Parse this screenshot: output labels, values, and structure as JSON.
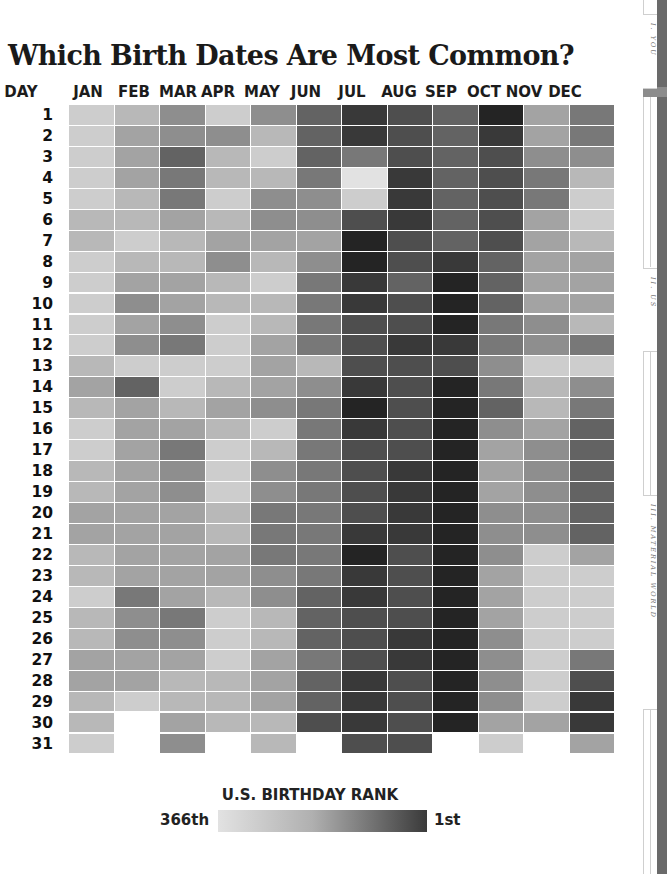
{
  "title": "Which Birth Dates Are Most Common?",
  "header": {
    "day_label": "DAY",
    "months": [
      "JAN",
      "FEB",
      "MAR",
      "APR",
      "MAY",
      "JUN",
      "JUL",
      "AUG",
      "SEP",
      "OCT",
      "NOV",
      "DEC"
    ]
  },
  "days": [
    "1",
    "2",
    "3",
    "4",
    "5",
    "6",
    "7",
    "8",
    "9",
    "10",
    "11",
    "12",
    "13",
    "14",
    "15",
    "16",
    "17",
    "18",
    "19",
    "20",
    "21",
    "22",
    "23",
    "24",
    "25",
    "26",
    "27",
    "28",
    "29",
    "30",
    "31"
  ],
  "legend": {
    "title": "U.S. BIRTHDAY RANK",
    "low_label": "366th",
    "high_label": "1st",
    "color_low": "#e2e2e2",
    "color_high": "#3a3a3a"
  },
  "side_tabs": [
    {
      "label": "I. YOU"
    },
    {
      "label": "II. US"
    },
    {
      "label": "III. MATERIAL WORLD"
    }
  ],
  "chart_data": {
    "type": "heatmap",
    "title": "Which Birth Dates Are Most Common?",
    "xlabel": "Month",
    "ylabel": "Day",
    "x_categories": [
      "JAN",
      "FEB",
      "MAR",
      "APR",
      "MAY",
      "JUN",
      "JUL",
      "AUG",
      "SEP",
      "OCT",
      "NOV",
      "DEC"
    ],
    "y_categories": [
      "1",
      "2",
      "3",
      "4",
      "5",
      "6",
      "7",
      "8",
      "9",
      "10",
      "11",
      "12",
      "13",
      "14",
      "15",
      "16",
      "17",
      "18",
      "19",
      "20",
      "21",
      "22",
      "23",
      "24",
      "25",
      "26",
      "27",
      "28",
      "29",
      "30",
      "31"
    ],
    "value_meaning": "relative birthday popularity (0 = least common / rank 366th, 9 = most common / rank 1st), estimated from shading",
    "legend": {
      "title": "U.S. BIRTHDAY RANK",
      "min_label": "366th",
      "max_label": "1st"
    },
    "values": [
      [
        1,
        2,
        4,
        1,
        4,
        6,
        8,
        7,
        6,
        9,
        3,
        5
      ],
      [
        1,
        3,
        4,
        4,
        2,
        6,
        8,
        7,
        6,
        8,
        3,
        5
      ],
      [
        1,
        3,
        6,
        2,
        1,
        6,
        5,
        7,
        6,
        7,
        4,
        4
      ],
      [
        1,
        3,
        5,
        2,
        2,
        5,
        0,
        8,
        6,
        7,
        5,
        2
      ],
      [
        1,
        2,
        5,
        1,
        4,
        4,
        1,
        8,
        6,
        7,
        5,
        1
      ],
      [
        2,
        2,
        3,
        2,
        4,
        4,
        7,
        8,
        6,
        7,
        3,
        1
      ],
      [
        2,
        1,
        2,
        3,
        3,
        3,
        9,
        7,
        6,
        7,
        3,
        2
      ],
      [
        1,
        2,
        2,
        4,
        2,
        4,
        9,
        7,
        8,
        6,
        3,
        3
      ],
      [
        1,
        3,
        3,
        2,
        1,
        5,
        8,
        6,
        9,
        6,
        3,
        3
      ],
      [
        1,
        4,
        3,
        2,
        2,
        5,
        8,
        7,
        9,
        6,
        3,
        3
      ],
      [
        1,
        3,
        4,
        1,
        2,
        5,
        7,
        7,
        9,
        5,
        4,
        2
      ],
      [
        1,
        4,
        5,
        1,
        3,
        5,
        7,
        8,
        8,
        5,
        4,
        5
      ],
      [
        2,
        1,
        1,
        1,
        3,
        2,
        7,
        7,
        7,
        4,
        1,
        1
      ],
      [
        3,
        6,
        1,
        2,
        3,
        4,
        8,
        7,
        9,
        5,
        2,
        4
      ],
      [
        2,
        3,
        2,
        3,
        4,
        5,
        9,
        7,
        9,
        6,
        2,
        5
      ],
      [
        1,
        3,
        3,
        2,
        1,
        5,
        8,
        7,
        9,
        4,
        3,
        6
      ],
      [
        1,
        3,
        5,
        1,
        2,
        5,
        7,
        7,
        9,
        3,
        4,
        6
      ],
      [
        2,
        3,
        4,
        1,
        4,
        5,
        7,
        8,
        9,
        3,
        4,
        6
      ],
      [
        2,
        3,
        4,
        1,
        4,
        5,
        7,
        8,
        9,
        3,
        4,
        6
      ],
      [
        3,
        3,
        3,
        2,
        5,
        5,
        7,
        8,
        9,
        4,
        4,
        6
      ],
      [
        3,
        3,
        3,
        2,
        5,
        5,
        8,
        8,
        9,
        4,
        4,
        6
      ],
      [
        2,
        3,
        3,
        3,
        5,
        5,
        9,
        7,
        9,
        4,
        1,
        3
      ],
      [
        2,
        3,
        3,
        3,
        4,
        5,
        8,
        7,
        9,
        3,
        1,
        1
      ],
      [
        1,
        5,
        3,
        2,
        4,
        6,
        8,
        7,
        9,
        3,
        1,
        1
      ],
      [
        2,
        4,
        5,
        1,
        2,
        6,
        7,
        7,
        9,
        3,
        1,
        1
      ],
      [
        2,
        4,
        4,
        1,
        2,
        6,
        7,
        8,
        9,
        4,
        1,
        1
      ],
      [
        3,
        3,
        3,
        1,
        3,
        5,
        7,
        8,
        9,
        4,
        1,
        5
      ],
      [
        3,
        3,
        2,
        2,
        3,
        6,
        8,
        7,
        9,
        4,
        1,
        7
      ],
      [
        2,
        1,
        2,
        2,
        3,
        6,
        8,
        7,
        9,
        4,
        1,
        8
      ],
      [
        2,
        null,
        3,
        2,
        2,
        7,
        8,
        7,
        9,
        3,
        3,
        8
      ],
      [
        1,
        null,
        4,
        null,
        2,
        null,
        7,
        7,
        null,
        1,
        null,
        3
      ]
    ],
    "grid": false,
    "legend_position": "bottom"
  }
}
